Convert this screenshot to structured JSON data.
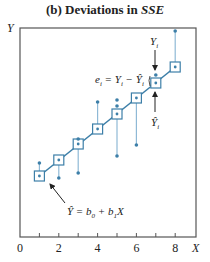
{
  "chart_data": {
    "type": "scatter",
    "title_prefix": "(b)  Deviations in ",
    "title_italic": "SSE",
    "xlabel": "X",
    "ylabel": "Y",
    "xlim": [
      0,
      9
    ],
    "x_ticks": [
      1,
      2,
      3,
      4,
      5,
      6,
      7,
      8
    ],
    "x_tick_labels": [
      "0",
      "2",
      "4",
      "6",
      "8"
    ],
    "x_tick_label_values": [
      0,
      2,
      4,
      6,
      8
    ],
    "fitted_points": [
      {
        "x": 1,
        "py": 176
      },
      {
        "x": 2,
        "py": 160
      },
      {
        "x": 3,
        "py": 144
      },
      {
        "x": 4,
        "py": 129
      },
      {
        "x": 5,
        "py": 114
      },
      {
        "x": 6,
        "py": 98
      },
      {
        "x": 7,
        "py": 83
      },
      {
        "x": 8,
        "py": 67
      }
    ],
    "observed_points": [
      {
        "x": 1,
        "py": 163
      },
      {
        "x": 2,
        "py": 178
      },
      {
        "x": 3,
        "py": 139
      },
      {
        "x": 3,
        "py": 173
      },
      {
        "x": 4,
        "py": 102
      },
      {
        "x": 5,
        "py": 100
      },
      {
        "x": 5,
        "py": 106
      },
      {
        "x": 5,
        "py": 156
      },
      {
        "x": 6,
        "py": 145
      },
      {
        "x": 7,
        "py": 75
      },
      {
        "x": 8,
        "py": 31
      }
    ],
    "residual_lines": [
      {
        "x": 1,
        "from": 176,
        "to": 163
      },
      {
        "x": 2,
        "from": 160,
        "to": 178
      },
      {
        "x": 3,
        "from": 144,
        "to": 173
      },
      {
        "x": 4,
        "from": 129,
        "to": 102
      },
      {
        "x": 5,
        "from": 114,
        "to": 156
      },
      {
        "x": 6,
        "from": 98,
        "to": 145
      },
      {
        "x": 8,
        "from": 67,
        "to": 31
      }
    ],
    "annotations": {
      "yi_label": "Y",
      "yi_sub": "i",
      "residual_label": "e",
      "residual_sub": "i",
      "residual_eq": " = Y",
      "residual_eq_sub": "i",
      "residual_minus": " − Ŷ",
      "residual_minus_sub": "i",
      "yhat_label": "Ŷ",
      "yhat_sub": "i",
      "line_eq_lhs": "Ŷ = b",
      "line_eq_sub0": "0",
      "line_eq_mid": " + b",
      "line_eq_sub1": "1",
      "line_eq_rhs": "X"
    },
    "colors": {
      "line": "#3d7fa8",
      "residual": "#8fb9d6",
      "marker": "#3d7fa8",
      "axis": "#555555",
      "text": "#222222"
    }
  }
}
